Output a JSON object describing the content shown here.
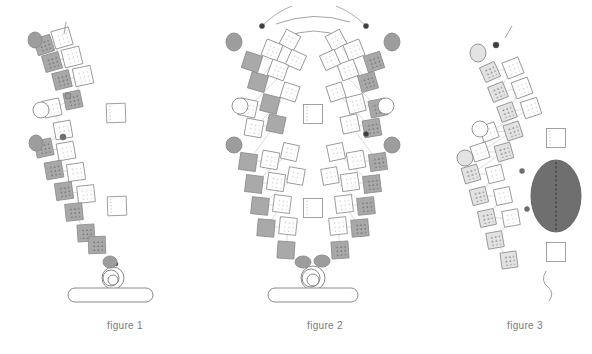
{
  "page": {
    "background": "#ffffff",
    "width": 592,
    "height": 354
  },
  "palette": {
    "stroke": "#8a8a8a",
    "stroke_dark": "#5e5e5e",
    "fill_white": "#ffffff",
    "fill_light_gray": "#e3e3e3",
    "fill_mid_gray": "#a9a9a9",
    "fill_dark_gray": "#6f6f6f",
    "dot_light": "#c9c9c9",
    "dot_dark": "#5a5a5a",
    "node_dark": "#3d3d3d",
    "caption_color": "#7a7a7a"
  },
  "captions": {
    "figure1": "figure 1",
    "figure2": "figure 2",
    "figure3": "figure 3"
  },
  "figures": [
    {
      "id": "figure1",
      "caption": "figure 1",
      "description": "Single leaning column of tilted square modules rising from a rounded base bar",
      "base": {
        "type": "rounded-bar",
        "x": 68,
        "y": 288,
        "width": 85,
        "height": 14
      },
      "coil": {
        "type": "concentric-circles",
        "cx": 113,
        "cy": 278,
        "radii": [
          11,
          8,
          5
        ]
      },
      "hub_ellipse": {
        "cx": 110,
        "cy": 262,
        "rx": 7,
        "ry": 6,
        "fill": "#9d9d9d"
      },
      "modules": [
        {
          "cx": 44,
          "cy": 45,
          "size": 17,
          "rot": -18,
          "fill": "#a9a9a9",
          "dots": "dark"
        },
        {
          "cx": 62,
          "cy": 38,
          "size": 18,
          "rot": -16,
          "fill": "#ffffff",
          "dots": "light"
        },
        {
          "cx": 52,
          "cy": 62,
          "size": 17,
          "rot": -16,
          "fill": "#a9a9a9",
          "dots": "dark"
        },
        {
          "cx": 72,
          "cy": 57,
          "size": 18,
          "rot": -14,
          "fill": "#ffffff",
          "dots": "light"
        },
        {
          "cx": 62,
          "cy": 80,
          "size": 17,
          "rot": -14,
          "fill": "#a9a9a9",
          "dots": "dark"
        },
        {
          "cx": 83,
          "cy": 76,
          "size": 18,
          "rot": -12,
          "fill": "#ffffff",
          "dots": "light"
        },
        {
          "cx": 73,
          "cy": 100,
          "size": 17,
          "rot": -12,
          "fill": "#a9a9a9",
          "dots": "dark"
        },
        {
          "cx": 52,
          "cy": 108,
          "size": 17,
          "rot": -12,
          "fill": "#ffffff",
          "dots": "light"
        },
        {
          "cx": 116,
          "cy": 113,
          "size": 19,
          "rot": -2,
          "fill": "#ffffff",
          "dots": "edge"
        },
        {
          "cx": 63,
          "cy": 130,
          "size": 17,
          "rot": -10,
          "fill": "#ffffff",
          "dots": "light"
        },
        {
          "cx": 44,
          "cy": 148,
          "size": 17,
          "rot": -12,
          "fill": "#a9a9a9",
          "dots": "dark"
        },
        {
          "cx": 66,
          "cy": 151,
          "size": 17,
          "rot": -10,
          "fill": "#ffffff",
          "dots": "light"
        },
        {
          "cx": 54,
          "cy": 170,
          "size": 17,
          "rot": -10,
          "fill": "#a9a9a9",
          "dots": "dark"
        },
        {
          "cx": 76,
          "cy": 172,
          "size": 17,
          "rot": -8,
          "fill": "#ffffff",
          "dots": "light"
        },
        {
          "cx": 64,
          "cy": 191,
          "size": 17,
          "rot": -8,
          "fill": "#a9a9a9",
          "dots": "dark"
        },
        {
          "cx": 86,
          "cy": 194,
          "size": 17,
          "rot": -6,
          "fill": "#ffffff",
          "dots": "light"
        },
        {
          "cx": 74,
          "cy": 212,
          "size": 17,
          "rot": -6,
          "fill": "#a9a9a9",
          "dots": "dark"
        },
        {
          "cx": 117,
          "cy": 206,
          "size": 19,
          "rot": -2,
          "fill": "#ffffff",
          "dots": "edge"
        },
        {
          "cx": 86,
          "cy": 233,
          "size": 17,
          "rot": -4,
          "fill": "#a9a9a9",
          "dots": "dark"
        },
        {
          "cx": 97,
          "cy": 245,
          "size": 17,
          "rot": -2,
          "fill": "#a9a9a9",
          "dots": "dark"
        }
      ],
      "side_ellipses": [
        {
          "cx": 35,
          "cy": 40,
          "rx": 7,
          "ry": 8,
          "fill": "#9d9d9d"
        },
        {
          "cx": 41,
          "cy": 110,
          "rx": 8,
          "ry": 8,
          "fill": "#ffffff"
        },
        {
          "cx": 36,
          "cy": 143,
          "rx": 7,
          "ry": 8,
          "fill": "#9d9d9d"
        }
      ],
      "nodes": [
        {
          "cx": 68,
          "cy": 96,
          "r": 3,
          "fill": "#9d9d9d"
        },
        {
          "cx": 63,
          "cy": 137,
          "r": 3,
          "fill": "#6f6f6f"
        },
        {
          "cx": 116,
          "cy": 264,
          "r": 2,
          "fill": "#3d3d3d"
        }
      ]
    },
    {
      "id": "figure2",
      "caption": "figure 2",
      "description": "Symmetric fan / V-shaped double column of tilted square modules converging on a rounded base bar",
      "base": {
        "type": "rounded-bar",
        "x": 268,
        "y": 288,
        "width": 90,
        "height": 14
      },
      "coil": {
        "type": "concentric-circles",
        "cx": 313,
        "cy": 278,
        "radii": [
          12,
          9,
          6
        ]
      },
      "hub_ellipses": [
        {
          "cx": 303,
          "cy": 262,
          "rx": 8,
          "ry": 6,
          "fill": "#9d9d9d"
        },
        {
          "cx": 322,
          "cy": 261,
          "rx": 8,
          "ry": 6,
          "fill": "#9d9d9d"
        }
      ],
      "arcs_top": [
        {
          "from": [
            276,
            24
          ],
          "to": [
            350,
            22
          ],
          "desc": "upper arc spanning crown"
        },
        {
          "from": [
            284,
            38
          ],
          "to": [
            344,
            38
          ],
          "desc": "lower crown arc"
        }
      ],
      "nodes": [
        {
          "cx": 262,
          "cy": 26,
          "r": 2.6,
          "fill": "#3d3d3d"
        },
        {
          "cx": 366,
          "cy": 26,
          "r": 2.6,
          "fill": "#3d3d3d"
        },
        {
          "cx": 366,
          "cy": 134,
          "r": 2.6,
          "fill": "#3d3d3d"
        }
      ],
      "side_ellipses": [
        {
          "cx": 234,
          "cy": 42,
          "rx": 8,
          "ry": 9,
          "fill": "#9d9d9d"
        },
        {
          "cx": 392,
          "cy": 42,
          "rx": 8,
          "ry": 9,
          "fill": "#9d9d9d"
        },
        {
          "cx": 240,
          "cy": 106,
          "rx": 8,
          "ry": 8,
          "fill": "#ffffff"
        },
        {
          "cx": 386,
          "cy": 106,
          "rx": 8,
          "ry": 8,
          "fill": "#ffffff"
        },
        {
          "cx": 234,
          "cy": 145,
          "rx": 8,
          "ry": 8,
          "fill": "#9d9d9d"
        },
        {
          "cx": 392,
          "cy": 145,
          "rx": 8,
          "ry": 8,
          "fill": "#9d9d9d"
        }
      ],
      "center_boxes": [
        {
          "cx": 313,
          "cy": 114,
          "size": 19,
          "rot": 0,
          "fill": "#ffffff",
          "dots": "edge"
        },
        {
          "cx": 313,
          "cy": 208,
          "size": 19,
          "rot": 0,
          "fill": "#ffffff",
          "dots": "edge"
        }
      ],
      "left_modules": [
        {
          "cx": 252,
          "cy": 62,
          "size": 17,
          "rot": 18,
          "fill": "#a9a9a9",
          "dots": "plain"
        },
        {
          "cx": 272,
          "cy": 50,
          "size": 17,
          "rot": 22,
          "fill": "#ffffff",
          "dots": "light"
        },
        {
          "cx": 290,
          "cy": 40,
          "size": 16,
          "rot": 28,
          "fill": "#ffffff",
          "dots": "light"
        },
        {
          "cx": 258,
          "cy": 82,
          "size": 17,
          "rot": 16,
          "fill": "#a9a9a9",
          "dots": "plain"
        },
        {
          "cx": 278,
          "cy": 70,
          "size": 17,
          "rot": 20,
          "fill": "#ffffff",
          "dots": "light"
        },
        {
          "cx": 296,
          "cy": 60,
          "size": 16,
          "rot": 24,
          "fill": "#ffffff",
          "dots": "light"
        },
        {
          "cx": 248,
          "cy": 108,
          "size": 17,
          "rot": 12,
          "fill": "#ffffff",
          "dots": "light"
        },
        {
          "cx": 270,
          "cy": 104,
          "size": 17,
          "rot": 14,
          "fill": "#a9a9a9",
          "dots": "plain"
        },
        {
          "cx": 290,
          "cy": 92,
          "size": 16,
          "rot": 18,
          "fill": "#ffffff",
          "dots": "light"
        },
        {
          "cx": 254,
          "cy": 128,
          "size": 17,
          "rot": 10,
          "fill": "#ffffff",
          "dots": "light"
        },
        {
          "cx": 276,
          "cy": 124,
          "size": 17,
          "rot": 12,
          "fill": "#a9a9a9",
          "dots": "plain"
        },
        {
          "cx": 248,
          "cy": 162,
          "size": 17,
          "rot": 8,
          "fill": "#a9a9a9",
          "dots": "plain"
        },
        {
          "cx": 270,
          "cy": 160,
          "size": 17,
          "rot": 10,
          "fill": "#ffffff",
          "dots": "light"
        },
        {
          "cx": 290,
          "cy": 152,
          "size": 16,
          "rot": 12,
          "fill": "#ffffff",
          "dots": "light"
        },
        {
          "cx": 254,
          "cy": 184,
          "size": 17,
          "rot": 7,
          "fill": "#a9a9a9",
          "dots": "plain"
        },
        {
          "cx": 276,
          "cy": 182,
          "size": 17,
          "rot": 8,
          "fill": "#ffffff",
          "dots": "light"
        },
        {
          "cx": 296,
          "cy": 176,
          "size": 16,
          "rot": 10,
          "fill": "#ffffff",
          "dots": "light"
        },
        {
          "cx": 260,
          "cy": 206,
          "size": 17,
          "rot": 6,
          "fill": "#a9a9a9",
          "dots": "plain"
        },
        {
          "cx": 282,
          "cy": 204,
          "size": 17,
          "rot": 7,
          "fill": "#ffffff",
          "dots": "light"
        },
        {
          "cx": 266,
          "cy": 228,
          "size": 17,
          "rot": 5,
          "fill": "#a9a9a9",
          "dots": "plain"
        },
        {
          "cx": 288,
          "cy": 226,
          "size": 17,
          "rot": 6,
          "fill": "#ffffff",
          "dots": "light"
        },
        {
          "cx": 286,
          "cy": 250,
          "size": 17,
          "rot": 4,
          "fill": "#a9a9a9",
          "dots": "plain"
        }
      ],
      "right_modules": [
        {
          "cx": 374,
          "cy": 62,
          "size": 17,
          "rot": -18,
          "fill": "#a9a9a9",
          "dots": "dark"
        },
        {
          "cx": 354,
          "cy": 50,
          "size": 17,
          "rot": -22,
          "fill": "#ffffff",
          "dots": "light"
        },
        {
          "cx": 336,
          "cy": 40,
          "size": 16,
          "rot": -28,
          "fill": "#ffffff",
          "dots": "light"
        },
        {
          "cx": 368,
          "cy": 82,
          "size": 17,
          "rot": -16,
          "fill": "#a9a9a9",
          "dots": "dark"
        },
        {
          "cx": 348,
          "cy": 70,
          "size": 17,
          "rot": -20,
          "fill": "#ffffff",
          "dots": "light"
        },
        {
          "cx": 330,
          "cy": 60,
          "size": 16,
          "rot": -24,
          "fill": "#ffffff",
          "dots": "light"
        },
        {
          "cx": 378,
          "cy": 108,
          "size": 17,
          "rot": -12,
          "fill": "#a9a9a9",
          "dots": "dark"
        },
        {
          "cx": 356,
          "cy": 104,
          "size": 17,
          "rot": -14,
          "fill": "#ffffff",
          "dots": "light"
        },
        {
          "cx": 336,
          "cy": 92,
          "size": 16,
          "rot": -18,
          "fill": "#ffffff",
          "dots": "light"
        },
        {
          "cx": 372,
          "cy": 128,
          "size": 17,
          "rot": -10,
          "fill": "#a9a9a9",
          "dots": "dark"
        },
        {
          "cx": 350,
          "cy": 124,
          "size": 17,
          "rot": -12,
          "fill": "#ffffff",
          "dots": "light"
        },
        {
          "cx": 378,
          "cy": 162,
          "size": 17,
          "rot": -8,
          "fill": "#a9a9a9",
          "dots": "dark"
        },
        {
          "cx": 356,
          "cy": 160,
          "size": 17,
          "rot": -10,
          "fill": "#ffffff",
          "dots": "light"
        },
        {
          "cx": 336,
          "cy": 152,
          "size": 16,
          "rot": -12,
          "fill": "#ffffff",
          "dots": "light"
        },
        {
          "cx": 372,
          "cy": 184,
          "size": 17,
          "rot": -7,
          "fill": "#a9a9a9",
          "dots": "dark"
        },
        {
          "cx": 350,
          "cy": 182,
          "size": 17,
          "rot": -8,
          "fill": "#ffffff",
          "dots": "light"
        },
        {
          "cx": 330,
          "cy": 176,
          "size": 16,
          "rot": -10,
          "fill": "#ffffff",
          "dots": "light"
        },
        {
          "cx": 366,
          "cy": 206,
          "size": 17,
          "rot": -6,
          "fill": "#a9a9a9",
          "dots": "dark"
        },
        {
          "cx": 344,
          "cy": 204,
          "size": 17,
          "rot": -7,
          "fill": "#ffffff",
          "dots": "light"
        },
        {
          "cx": 360,
          "cy": 228,
          "size": 17,
          "rot": -5,
          "fill": "#a9a9a9",
          "dots": "dark"
        },
        {
          "cx": 338,
          "cy": 226,
          "size": 17,
          "rot": -6,
          "fill": "#ffffff",
          "dots": "light"
        },
        {
          "cx": 340,
          "cy": 250,
          "size": 17,
          "rot": -4,
          "fill": "#a9a9a9",
          "dots": "dark"
        }
      ]
    },
    {
      "id": "figure3",
      "caption": "figure 3",
      "description": "Diagonal band of pale modules with a large dark filled ellipse and a trailing tail curve",
      "dark_ellipse": {
        "cx": 556,
        "cy": 196,
        "rx": 25,
        "ry": 36,
        "fill": "#6f6f6f",
        "has_dotted_axis": true
      },
      "modules": [
        {
          "cx": 490,
          "cy": 72,
          "size": 16,
          "rot": -24,
          "fill": "#e3e3e3",
          "dots": "dark"
        },
        {
          "cx": 513,
          "cy": 68,
          "size": 17,
          "rot": -22,
          "fill": "#ffffff",
          "dots": "light"
        },
        {
          "cx": 498,
          "cy": 92,
          "size": 16,
          "rot": -22,
          "fill": "#e3e3e3",
          "dots": "dark"
        },
        {
          "cx": 522,
          "cy": 88,
          "size": 17,
          "rot": -20,
          "fill": "#ffffff",
          "dots": "light"
        },
        {
          "cx": 507,
          "cy": 112,
          "size": 16,
          "rot": -20,
          "fill": "#e3e3e3",
          "dots": "dark"
        },
        {
          "cx": 531,
          "cy": 108,
          "size": 17,
          "rot": -18,
          "fill": "#ffffff",
          "dots": "light"
        },
        {
          "cx": 489,
          "cy": 132,
          "size": 16,
          "rot": -20,
          "fill": "#ffffff",
          "dots": "light"
        },
        {
          "cx": 513,
          "cy": 131,
          "size": 16,
          "rot": -18,
          "fill": "#e3e3e3",
          "dots": "dark"
        },
        {
          "cx": 556,
          "cy": 138,
          "size": 19,
          "rot": 0,
          "fill": "#ffffff",
          "dots": "edge"
        },
        {
          "cx": 480,
          "cy": 152,
          "size": 16,
          "rot": -18,
          "fill": "#ffffff",
          "dots": "light"
        },
        {
          "cx": 504,
          "cy": 152,
          "size": 16,
          "rot": -16,
          "fill": "#e3e3e3",
          "dots": "dark"
        },
        {
          "cx": 471,
          "cy": 174,
          "size": 16,
          "rot": -16,
          "fill": "#e3e3e3",
          "dots": "dark"
        },
        {
          "cx": 495,
          "cy": 174,
          "size": 16,
          "rot": -14,
          "fill": "#ffffff",
          "dots": "light"
        },
        {
          "cx": 479,
          "cy": 196,
          "size": 16,
          "rot": -14,
          "fill": "#e3e3e3",
          "dots": "dark"
        },
        {
          "cx": 503,
          "cy": 196,
          "size": 16,
          "rot": -12,
          "fill": "#ffffff",
          "dots": "light"
        },
        {
          "cx": 487,
          "cy": 218,
          "size": 16,
          "rot": -12,
          "fill": "#e3e3e3",
          "dots": "dark"
        },
        {
          "cx": 511,
          "cy": 218,
          "size": 16,
          "rot": -10,
          "fill": "#ffffff",
          "dots": "light"
        },
        {
          "cx": 495,
          "cy": 240,
          "size": 16,
          "rot": -10,
          "fill": "#e3e3e3",
          "dots": "dark"
        },
        {
          "cx": 556,
          "cy": 252,
          "size": 19,
          "rot": 0,
          "fill": "#ffffff",
          "dots": "plain"
        },
        {
          "cx": 509,
          "cy": 260,
          "size": 16,
          "rot": -8,
          "fill": "#e3e3e3",
          "dots": "dark"
        }
      ],
      "side_ellipses": [
        {
          "cx": 478,
          "cy": 53,
          "rx": 8,
          "ry": 9,
          "fill": "#e3e3e3"
        },
        {
          "cx": 480,
          "cy": 129,
          "rx": 8,
          "ry": 8,
          "fill": "#ffffff"
        },
        {
          "cx": 465,
          "cy": 158,
          "rx": 8,
          "ry": 8,
          "fill": "#e3e3e3"
        }
      ],
      "nodes": [
        {
          "cx": 496,
          "cy": 45,
          "r": 3,
          "fill": "#3d3d3d"
        },
        {
          "cx": 522,
          "cy": 171,
          "r": 2.5,
          "fill": "#6f6f6f"
        },
        {
          "cx": 527,
          "cy": 209,
          "r": 2.5,
          "fill": "#6f6f6f"
        }
      ],
      "tail": {
        "desc": "wavy trailing curve descending from lower-right box",
        "from": [
          556,
          271
        ],
        "to": [
          546,
          300
        ]
      }
    }
  ]
}
